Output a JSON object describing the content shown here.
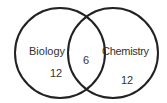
{
  "diagram": {
    "type": "venn",
    "sets": [
      {
        "label": "Biology",
        "only_count": "12"
      },
      {
        "label": "Chemistry",
        "only_count": "12"
      }
    ],
    "intersection_count": "6",
    "colors": {
      "stroke": "#222222",
      "text": "#333333",
      "background": "#ffffff"
    }
  }
}
